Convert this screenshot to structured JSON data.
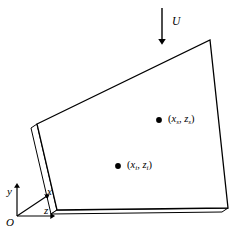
{
  "figure": {
    "background_color": "#ffffff",
    "line_color": "#000000",
    "face_color": "#ffffff",
    "width": 242,
    "height": 244
  },
  "flow": {
    "label": "U",
    "arrow_direction": "down",
    "arrow_x": 162,
    "arrow_y_start": 8,
    "arrow_y_end": 41,
    "label_x": 172,
    "label_y": 16
  },
  "plate": {
    "name": "plate-body",
    "front_face_points": "37,124 210,40 228,208 57,210",
    "left_face_points": "37,124 31,128 51,214 57,210",
    "bottom_face_points": "57,210 51,214 222,212 228,208",
    "vertices": [
      {
        "name": "top-left",
        "x": 37,
        "y": 124
      },
      {
        "name": "top-right",
        "x": 210,
        "y": 40
      },
      {
        "name": "bottom-right",
        "x": 228,
        "y": 208
      },
      {
        "name": "bottom-left",
        "x": 57,
        "y": 210
      }
    ]
  },
  "points": [
    {
      "name": "point-s",
      "dot_x": 159,
      "dot_y": 120,
      "label_x": 168,
      "label_y": 114,
      "open_paren": "(",
      "x_var": "x",
      "x_sub": "s",
      "comma": ", ",
      "z_var": "z",
      "z_sub": "s",
      "close_paren": ")"
    },
    {
      "name": "point-i",
      "dot_x": 118,
      "dot_y": 166,
      "label_x": 127,
      "label_y": 160,
      "open_paren": "(",
      "x_var": "x",
      "x_sub": "i",
      "comma": ", ",
      "z_var": "z",
      "z_sub": "i",
      "close_paren": ")"
    }
  ],
  "axes": {
    "origin": {
      "label": "O",
      "x": 17,
      "y": 216,
      "label_x": 6,
      "label_y": 217
    },
    "y_axis": {
      "label": "y",
      "tip_x": 17,
      "tip_y": 186,
      "label_x": 7,
      "label_y": 186
    },
    "x_axis": {
      "label": "x",
      "tip_x": 47,
      "tip_y": 196,
      "label_x": 47,
      "label_y": 186
    },
    "z_axis": {
      "label": "z",
      "tip_x": 52,
      "tip_y": 216,
      "label_x": 44,
      "label_y": 205
    }
  }
}
